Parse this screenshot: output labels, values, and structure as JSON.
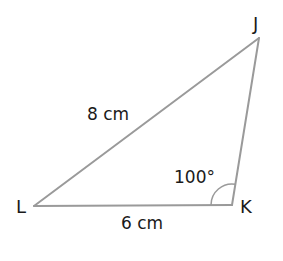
{
  "diagram": {
    "type": "triangle",
    "colors": {
      "line": "#9a9a9a",
      "text": "#1a1a1a",
      "background": "#ffffff"
    },
    "vertices": [
      {
        "name": "J",
        "x": 259,
        "y": 38
      },
      {
        "name": "K",
        "x": 232,
        "y": 205
      },
      {
        "name": "L",
        "x": 34,
        "y": 206
      }
    ],
    "sides": [
      {
        "from": "L",
        "to": "J",
        "label": "8 cm"
      },
      {
        "from": "L",
        "to": "K",
        "label": "6 cm"
      },
      {
        "from": "K",
        "to": "J",
        "label": ""
      }
    ],
    "angles": [
      {
        "vertex": "K",
        "label": "100°",
        "arc": true
      }
    ]
  },
  "labels": {
    "vertex_j": "J",
    "vertex_k": "K",
    "vertex_l": "L",
    "side_lj": "8 cm",
    "side_lk": "6 cm",
    "angle_k": "100°"
  }
}
